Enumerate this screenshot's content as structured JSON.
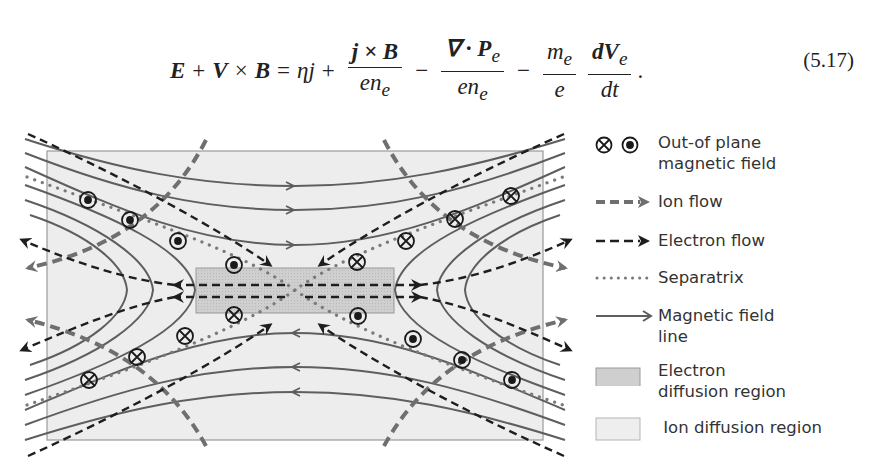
{
  "equation": {
    "lhs": [
      "E",
      "+",
      "V",
      "×",
      "B",
      "="
    ],
    "terms": {
      "eta_j": "ηj",
      "hall_num": "j × B",
      "hall_den": "en",
      "hall_den_sub": "e",
      "pressure_num": "∇ · P",
      "pressure_num_sub": "e",
      "pressure_den": "en",
      "pressure_den_sub": "e",
      "mass_num": "m",
      "mass_num_sub": "e",
      "mass_den": "e",
      "inertia_num": "dV",
      "inertia_num_sub": "e",
      "inertia_den": "dt"
    },
    "number": "(5.17)"
  },
  "figure": {
    "colors": {
      "field_line": "#5e5e5e",
      "ion_flow": "#6f6f6f",
      "electron_flow": "#1e1e1e",
      "separatrix": "#7a7a7a",
      "ion_region": "#ededed",
      "ion_region_border": "#9a9a9a",
      "electron_region": "#cfcfcf",
      "electron_region_border": "#9a9a9a",
      "symbol": "#1a1a1a"
    }
  },
  "legend": {
    "items": [
      {
        "symbol": "into-and-out-of-plane-icons",
        "label_lines": [
          "Out-of plane",
          "magnetic field"
        ]
      },
      {
        "symbol": "ion-flow-arrow",
        "label_lines": [
          "Ion flow"
        ]
      },
      {
        "symbol": "electron-flow-arrow",
        "label_lines": [
          "Electron flow"
        ]
      },
      {
        "symbol": "dotted-line",
        "label_lines": [
          "Separatrix"
        ]
      },
      {
        "symbol": "solid-arrow",
        "label_lines": [
          "Magnetic field",
          "line"
        ]
      },
      {
        "symbol": "dark-gray-box",
        "label_lines": [
          "Electron",
          "diffusion region"
        ]
      },
      {
        "symbol": "light-gray-box",
        "label_lines": [
          " Ion diffusion region"
        ]
      }
    ]
  }
}
